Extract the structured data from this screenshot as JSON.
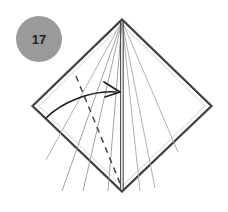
{
  "figure": {
    "kind": "origami-fold-diagram",
    "step_number": "17",
    "background_color": "#ffffff",
    "canvas": {
      "width": 228,
      "height": 212
    }
  },
  "step_badge": {
    "label": "17",
    "fill_color": "#9a9a9a",
    "text_color": "#222222",
    "center_x": 39,
    "center_y": 39,
    "radius": 23
  },
  "shape": {
    "name": "kite-outline",
    "stroke_color": "#3d3d3d",
    "inner_stroke_color": "#8c8c8c",
    "vertices": {
      "top": {
        "x": 122,
        "y": 20
      },
      "left": {
        "x": 33,
        "y": 106
      },
      "bottom": {
        "x": 122,
        "y": 191
      },
      "right": {
        "x": 211,
        "y": 106
      }
    },
    "outline_points": "122,20 33,106 122,191 211,106"
  },
  "center_line": {
    "name": "vertical-center-crease",
    "x1": 122,
    "y1": 20,
    "x2": 122,
    "y2": 191,
    "color": "#3d3d3d"
  },
  "crease_lines": [
    {
      "name": "crease-left-1",
      "x1": 122,
      "y1": 21,
      "x2": 62,
      "y2": 191,
      "color": "#9a9a9a"
    },
    {
      "name": "crease-left-2",
      "x1": 122,
      "y1": 21,
      "x2": 83,
      "y2": 191,
      "color": "#9a9a9a"
    },
    {
      "name": "crease-left-3",
      "x1": 122,
      "y1": 21,
      "x2": 108,
      "y2": 191,
      "color": "#9a9a9a"
    },
    {
      "name": "crease-left-4",
      "x1": 122,
      "y1": 21,
      "x2": 46,
      "y2": 160,
      "color": "#a8a8a8"
    },
    {
      "name": "crease-right-1",
      "x1": 122,
      "y1": 21,
      "x2": 178,
      "y2": 152,
      "color": "#a8a8a8"
    },
    {
      "name": "crease-right-2",
      "x1": 122,
      "y1": 21,
      "x2": 155,
      "y2": 188,
      "color": "#a8a8a8"
    },
    {
      "name": "crease-right-3",
      "x1": 122,
      "y1": 21,
      "x2": 140,
      "y2": 191,
      "color": "#a8a8a8"
    }
  ],
  "dashed_fold": {
    "name": "valley-fold-dashed-line",
    "x1": 76,
    "y1": 76,
    "x2": 122,
    "y2": 188,
    "color": "#444444",
    "dash_pattern": "6 5"
  },
  "fold_arrow": {
    "name": "fold-direction-arrow",
    "path": "M 46 118 C 62 102, 92 90, 116 92",
    "color": "#1f1f1f",
    "head_tip_x": 120,
    "head_tip_y": 92,
    "head_upper": "104,82 120,92",
    "head_lower": "105,97 120,92"
  }
}
